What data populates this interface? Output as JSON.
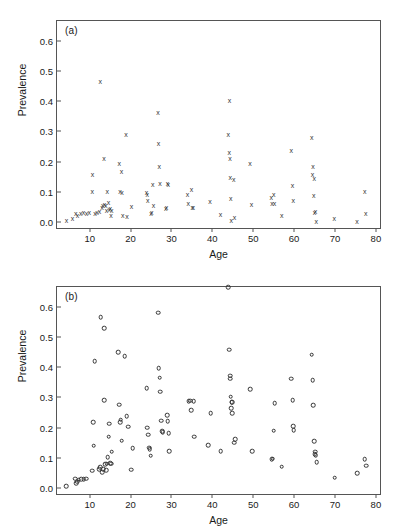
{
  "figure": {
    "panels": [
      "a",
      "b"
    ]
  },
  "chart_data": [
    {
      "type": "scatter",
      "panel_label": "(a)",
      "title": "",
      "xlabel": "Age",
      "ylabel": "Prevalence",
      "marker": "x",
      "xlim": [
        2,
        81
      ],
      "ylim": [
        -0.02,
        0.665
      ],
      "xticks": [
        10,
        20,
        30,
        40,
        50,
        60,
        70,
        80
      ],
      "xticklabels": [
        "10",
        "20",
        "30",
        "40",
        "50",
        "60",
        "70",
        "80"
      ],
      "yticks": [
        0.0,
        0.1,
        0.2,
        0.3,
        0.4,
        0.5,
        0.6
      ],
      "yticklabels": [
        "0.0",
        "0.1",
        "0.2",
        "0.3",
        "0.4",
        "0.5",
        "0.6"
      ],
      "grid": false,
      "legend": "none",
      "points": [
        [
          4.3,
          0.008
        ],
        [
          5.8,
          0.012
        ],
        [
          6.6,
          0.03
        ],
        [
          7.0,
          0.022
        ],
        [
          7.8,
          0.03
        ],
        [
          8.5,
          0.032
        ],
        [
          9.2,
          0.031
        ],
        [
          9.9,
          0.033
        ],
        [
          10.6,
          0.101
        ],
        [
          10.7,
          0.16
        ],
        [
          11.3,
          0.03
        ],
        [
          11.8,
          0.032
        ],
        [
          12.4,
          0.035
        ],
        [
          12.6,
          0.465
        ],
        [
          13.0,
          0.051
        ],
        [
          13.2,
          0.056
        ],
        [
          13.5,
          0.211
        ],
        [
          13.6,
          0.058
        ],
        [
          13.9,
          0.056
        ],
        [
          14.1,
          0.039
        ],
        [
          14.3,
          0.101
        ],
        [
          14.6,
          0.066
        ],
        [
          14.8,
          0.042
        ],
        [
          15.0,
          0.045
        ],
        [
          15.2,
          0.022
        ],
        [
          15.4,
          0.04
        ],
        [
          17.2,
          0.196
        ],
        [
          17.4,
          0.101
        ],
        [
          17.8,
          0.168
        ],
        [
          17.9,
          0.1
        ],
        [
          18.1,
          0.022
        ],
        [
          18.9,
          0.29
        ],
        [
          19.1,
          0.02
        ],
        [
          20.2,
          0.054
        ],
        [
          23.9,
          0.1
        ],
        [
          24.1,
          0.092
        ],
        [
          24.2,
          0.073
        ],
        [
          25.0,
          0.031
        ],
        [
          25.2,
          0.033
        ],
        [
          25.4,
          0.127
        ],
        [
          25.6,
          0.055
        ],
        [
          26.7,
          0.363
        ],
        [
          26.8,
          0.26
        ],
        [
          27.0,
          0.186
        ],
        [
          27.2,
          0.13
        ],
        [
          28.6,
          0.046
        ],
        [
          28.8,
          0.051
        ],
        [
          29.0,
          0.128
        ],
        [
          29.2,
          0.126
        ],
        [
          33.9,
          0.092
        ],
        [
          34.1,
          0.063
        ],
        [
          34.9,
          0.108
        ],
        [
          35.1,
          0.05
        ],
        [
          35.3,
          0.049
        ],
        [
          39.4,
          0.071
        ],
        [
          42.0,
          0.026
        ],
        [
          43.9,
          0.29
        ],
        [
          44.1,
          0.232
        ],
        [
          44.2,
          0.404
        ],
        [
          44.3,
          0.211
        ],
        [
          44.4,
          0.149
        ],
        [
          44.5,
          0.078
        ],
        [
          44.6,
          0.005
        ],
        [
          45.2,
          0.141
        ],
        [
          45.4,
          0.015
        ],
        [
          49.2,
          0.196
        ],
        [
          49.6,
          0.06
        ],
        [
          54.4,
          0.083
        ],
        [
          54.6,
          0.063
        ],
        [
          55.0,
          0.091
        ],
        [
          55.2,
          0.063
        ],
        [
          57.0,
          0.023
        ],
        [
          59.3,
          0.239
        ],
        [
          59.6,
          0.121
        ],
        [
          59.8,
          0.073
        ],
        [
          64.3,
          0.282
        ],
        [
          64.5,
          0.16
        ],
        [
          64.6,
          0.185
        ],
        [
          64.8,
          0.089
        ],
        [
          64.9,
          0.147
        ],
        [
          65.0,
          0.034
        ],
        [
          65.2,
          0.035
        ],
        [
          65.4,
          0.002
        ],
        [
          69.8,
          0.013
        ],
        [
          75.4,
          0.003
        ],
        [
          77.3,
          0.101
        ],
        [
          77.5,
          0.029
        ]
      ]
    },
    {
      "type": "scatter",
      "panel_label": "(b)",
      "title": "",
      "xlabel": "Age",
      "ylabel": "Prevalence",
      "marker": "o",
      "xlim": [
        2,
        81
      ],
      "ylim": [
        -0.02,
        0.665
      ],
      "xticks": [
        10,
        20,
        30,
        40,
        50,
        60,
        70,
        80
      ],
      "xticklabels": [
        "10",
        "20",
        "30",
        "40",
        "50",
        "60",
        "70",
        "80"
      ],
      "yticks": [
        0.0,
        0.1,
        0.2,
        0.3,
        0.4,
        0.5,
        0.6
      ],
      "yticklabels": [
        "0.0",
        "0.1",
        "0.2",
        "0.3",
        "0.4",
        "0.5",
        "0.6"
      ],
      "grid": false,
      "legend": "none",
      "points": [
        [
          4.3,
          0.006
        ],
        [
          6.5,
          0.03
        ],
        [
          6.7,
          0.016
        ],
        [
          6.9,
          0.021
        ],
        [
          7.3,
          0.027
        ],
        [
          7.9,
          0.029
        ],
        [
          8.5,
          0.028
        ],
        [
          9.1,
          0.031
        ],
        [
          10.6,
          0.057
        ],
        [
          10.8,
          0.218
        ],
        [
          11.0,
          0.14
        ],
        [
          11.2,
          0.419
        ],
        [
          12.3,
          0.063
        ],
        [
          12.5,
          0.069
        ],
        [
          12.7,
          0.565
        ],
        [
          13.0,
          0.052
        ],
        [
          13.3,
          0.063
        ],
        [
          13.5,
          0.529
        ],
        [
          13.6,
          0.29
        ],
        [
          13.8,
          0.079
        ],
        [
          14.0,
          0.058
        ],
        [
          14.2,
          0.08
        ],
        [
          14.4,
          0.102
        ],
        [
          14.6,
          0.169
        ],
        [
          14.8,
          0.213
        ],
        [
          15.0,
          0.081
        ],
        [
          15.2,
          0.08
        ],
        [
          15.4,
          0.12
        ],
        [
          16.9,
          0.449
        ],
        [
          17.2,
          0.275
        ],
        [
          17.4,
          0.218
        ],
        [
          17.6,
          0.226
        ],
        [
          17.8,
          0.156
        ],
        [
          18.6,
          0.436
        ],
        [
          19.0,
          0.238
        ],
        [
          19.4,
          0.203
        ],
        [
          20.1,
          0.06
        ],
        [
          20.5,
          0.131
        ],
        [
          23.9,
          0.331
        ],
        [
          24.1,
          0.199
        ],
        [
          24.3,
          0.176
        ],
        [
          24.5,
          0.133
        ],
        [
          24.7,
          0.128
        ],
        [
          24.9,
          0.107
        ],
        [
          26.7,
          0.58
        ],
        [
          26.9,
          0.397
        ],
        [
          27.1,
          0.365
        ],
        [
          27.3,
          0.318
        ],
        [
          27.5,
          0.222
        ],
        [
          27.7,
          0.188
        ],
        [
          27.9,
          0.185
        ],
        [
          28.9,
          0.24
        ],
        [
          29.1,
          0.221
        ],
        [
          29.3,
          0.181
        ],
        [
          29.5,
          0.122
        ],
        [
          34.2,
          0.288
        ],
        [
          34.6,
          0.289
        ],
        [
          34.8,
          0.258
        ],
        [
          35.4,
          0.288
        ],
        [
          35.6,
          0.17
        ],
        [
          39.0,
          0.141
        ],
        [
          39.6,
          0.247
        ],
        [
          42.0,
          0.122
        ],
        [
          43.9,
          0.665
        ],
        [
          44.1,
          0.458
        ],
        [
          44.3,
          0.372
        ],
        [
          44.4,
          0.362
        ],
        [
          44.5,
          0.302
        ],
        [
          44.6,
          0.263
        ],
        [
          44.7,
          0.283
        ],
        [
          44.8,
          0.247
        ],
        [
          44.9,
          0.283
        ],
        [
          45.3,
          0.15
        ],
        [
          45.6,
          0.162
        ],
        [
          49.3,
          0.327
        ],
        [
          49.7,
          0.122
        ],
        [
          54.5,
          0.096
        ],
        [
          54.8,
          0.097
        ],
        [
          55.0,
          0.19
        ],
        [
          55.2,
          0.28
        ],
        [
          57.0,
          0.07
        ],
        [
          59.3,
          0.362
        ],
        [
          59.6,
          0.29
        ],
        [
          59.8,
          0.205
        ],
        [
          59.9,
          0.192
        ],
        [
          64.3,
          0.441
        ],
        [
          64.5,
          0.357
        ],
        [
          64.7,
          0.273
        ],
        [
          64.9,
          0.155
        ],
        [
          65.0,
          0.112
        ],
        [
          65.2,
          0.12
        ],
        [
          65.3,
          0.108
        ],
        [
          65.5,
          0.086
        ],
        [
          69.9,
          0.034
        ],
        [
          75.4,
          0.049
        ],
        [
          77.3,
          0.096
        ],
        [
          77.6,
          0.073
        ]
      ]
    }
  ]
}
